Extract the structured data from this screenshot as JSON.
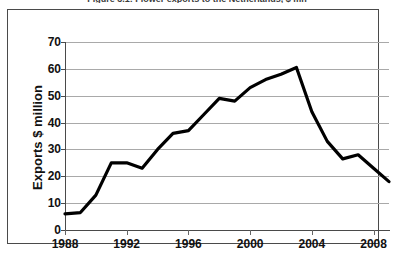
{
  "caption": "Figure 3.1: Flower exports to the Netherlands, $ mn",
  "chart_data": {
    "type": "line",
    "title": "Figure 3.1: Flower exports to the Netherlands, $ mn",
    "xlabel": "",
    "ylabel": "Exports $ million",
    "ylim": [
      0,
      70
    ],
    "xlim": [
      1988,
      2009
    ],
    "grid": true,
    "legend": false,
    "y_ticks": [
      70,
      60,
      50,
      40,
      30,
      20,
      10,
      0
    ],
    "x_ticks": [
      1988,
      1992,
      1996,
      2000,
      2004,
      2008
    ],
    "x": [
      1988,
      1989,
      1990,
      1991,
      1992,
      1993,
      1994,
      1995,
      1996,
      1997,
      1998,
      1999,
      2000,
      2001,
      2002,
      2003,
      2004,
      2005,
      2006,
      2007,
      2008,
      2009
    ],
    "values": [
      6,
      6.5,
      13,
      25,
      25,
      23,
      30,
      36,
      37,
      43,
      49,
      48,
      53,
      56,
      58,
      60.5,
      44,
      33,
      26.5,
      28,
      23,
      18
    ],
    "series_color": "#000000",
    "grid_color": "#a9a9a9",
    "frame_color": "#4a4a4a",
    "background": "#ffffff"
  }
}
